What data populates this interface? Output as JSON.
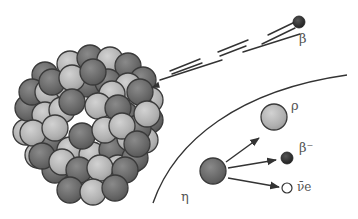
{
  "diagram": {
    "type": "beta-decay-illustration",
    "labels": {
      "emitted_particle": "β",
      "neutron": "η",
      "proton": "ρ",
      "electron": "β⁻",
      "antineutrino": "ν̄e"
    },
    "colors": {
      "light_nucleon": "#b4b4b4",
      "dark_nucleon": "#6e6e6e",
      "outline": "#333333",
      "electron": "#2a2a2a",
      "line": "#333333",
      "text": "#555555"
    }
  }
}
